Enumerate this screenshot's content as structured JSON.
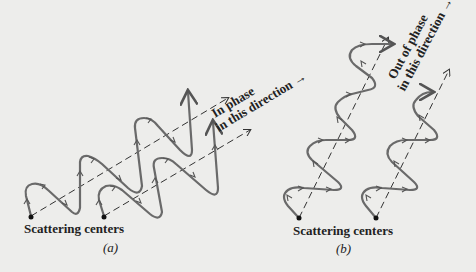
{
  "figure": {
    "panel_a": {
      "caption": "(a)",
      "label_scattering": "Scattering centers",
      "annotation_line1": "In phase",
      "annotation_line2": "in this direction →"
    },
    "panel_b": {
      "caption": "(b)",
      "label_scattering": "Scattering centers",
      "annotation_line1": "Out of phase",
      "annotation_line2": "in this direction →"
    },
    "colors": {
      "background": "#ededeb",
      "wave": "#6a6a6a",
      "text": "#222222"
    }
  }
}
